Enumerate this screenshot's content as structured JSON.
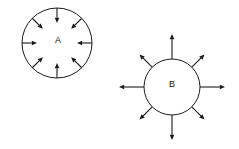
{
  "figure": {
    "background_color": "#ffffff",
    "stroke_color": "#1a1a1a",
    "width": 239,
    "height": 149
  },
  "diagram": {
    "type": "force-vector-diagram",
    "objects": [
      {
        "id": "A",
        "label": "A",
        "center_x": 57,
        "center_y": 43,
        "radius": 35,
        "arrow_direction": "inward",
        "arrow_count": 8,
        "arrow_length_cardinal": 15,
        "arrow_length_diagonal": 15,
        "label_x": 58,
        "label_y": 41,
        "arrow_angles_deg": [
          0,
          45,
          90,
          135,
          180,
          225,
          270,
          315
        ]
      },
      {
        "id": "B",
        "label": "B",
        "center_x": 172,
        "center_y": 87,
        "radius": 28,
        "arrow_direction": "outward",
        "arrow_count": 8,
        "arrow_length_cardinal": 25,
        "arrow_length_diagonal": 18,
        "label_x": 172,
        "label_y": 85,
        "arrow_angles_deg": [
          0,
          45,
          90,
          135,
          180,
          225,
          270,
          315
        ]
      }
    ]
  }
}
